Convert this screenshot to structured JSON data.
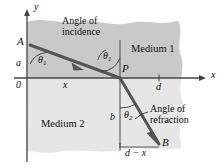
{
  "figure": {
    "background_color": "#ffffff",
    "medium1_color": "#c9c9c9",
    "medium2_color": "#e6e6e6",
    "ray_color": "#4d4d4d",
    "axis_color": "#444444"
  },
  "axes": {
    "x_label": "x",
    "y_label": "y",
    "origin_label": "0"
  },
  "points": {
    "A": "A",
    "B": "B",
    "P": "P"
  },
  "media": {
    "upper": "Medium 1",
    "lower": "Medium 2"
  },
  "angles": {
    "theta1_symbol": "θ",
    "theta1_sub": "1",
    "theta2_symbol": "θ",
    "theta2_sub": "2",
    "incidence_line1": "Angle of",
    "incidence_line2": "incidence",
    "refraction_line1": "Angle of",
    "refraction_line2": "refraction"
  },
  "dimensions": {
    "a": "a",
    "b": "b",
    "x": "x",
    "d": "d",
    "d_minus_x": "d − x"
  }
}
